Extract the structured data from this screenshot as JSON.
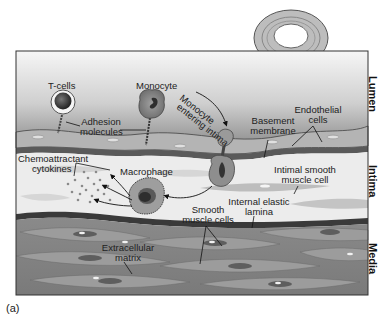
{
  "figure": {
    "caption": "(a)",
    "regions": {
      "lumen": "Lumen",
      "intima": "Intima",
      "media": "Media"
    },
    "labels": {
      "t_cells": "T-cells",
      "monocyte": "Monocyte",
      "monocyte_entering_1": "Monocyte",
      "monocyte_entering_2": "entering intima",
      "adhesion_1": "Adhesion",
      "adhesion_2": "molecules",
      "basement_1": "Basement",
      "basement_2": "membrane",
      "endothelial_1": "Endothelial",
      "endothelial_2": "cells",
      "chemo_1": "Chemoattractant",
      "chemo_2": "cytokines",
      "macrophage": "Macrophage",
      "intimal_smc_1": "Intimal smooth",
      "intimal_smc_2": "muscle cell",
      "internal_elastic_1": "Internal elastic",
      "internal_elastic_2": "lamina",
      "smc_1": "Smooth",
      "smc_2": "muscle cells",
      "ecm_1": "Extracellular",
      "ecm_2": "matrix"
    },
    "colors": {
      "lumen_top": "#f4f4f4",
      "lumen_bottom": "#8c8c8c",
      "endothelium": "#a8a8a8",
      "intima": "#ececec",
      "media": "#8a8a8a",
      "cell_dark": "#3a3a3a"
    }
  }
}
